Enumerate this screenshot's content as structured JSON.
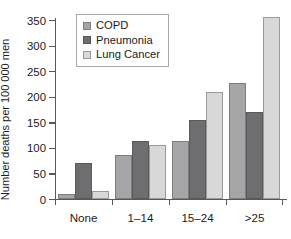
{
  "chart_data": {
    "type": "bar",
    "title": "",
    "xlabel": "",
    "ylabel": "Number deaths per 100 000 men",
    "categories": [
      "None",
      "1–14",
      "15–24",
      ">25"
    ],
    "series": [
      {
        "name": "COPD",
        "color": "#a5a5a7",
        "values": [
          10,
          87,
          113,
          226
        ]
      },
      {
        "name": "Pneumonia",
        "color": "#6e6e70",
        "values": [
          71,
          113,
          155,
          171
        ]
      },
      {
        "name": "Lung Cancer",
        "color": "#d8d8d8",
        "values": [
          15,
          106,
          210,
          355
        ]
      }
    ],
    "ylim": [
      0,
      350
    ],
    "yticks": [
      0,
      50,
      100,
      150,
      200,
      250,
      300,
      350
    ],
    "ytick_labels": [
      "0",
      "50",
      "100",
      "150",
      "200",
      "250",
      "300",
      "350"
    ],
    "grid": false,
    "legend_position": "top-left",
    "legend_entries": [
      "COPD",
      "Pneumonia",
      "Lung Cancer"
    ]
  }
}
